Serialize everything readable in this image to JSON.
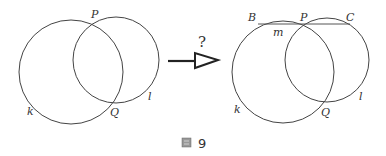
{
  "diagram": {
    "left": {
      "circles": [
        {
          "name": "k",
          "cx": 71,
          "cy": 72,
          "r": 52
        },
        {
          "name": "l",
          "cx": 116,
          "cy": 60,
          "r": 43
        }
      ],
      "labels": {
        "P": "P",
        "Q": "Q",
        "k": "k",
        "l": "l"
      }
    },
    "arrow": {
      "question": "?"
    },
    "right": {
      "circles": [
        {
          "name": "k",
          "cx": 283,
          "cy": 72,
          "r": 51
        },
        {
          "name": "l",
          "cx": 327,
          "cy": 60,
          "r": 42
        }
      ],
      "line": {
        "name": "m",
        "from": "B",
        "to": "C",
        "through": "P"
      },
      "labels": {
        "B": "B",
        "P": "P",
        "C": "C",
        "m": "m",
        "Q": "Q",
        "k": "k",
        "l": "l"
      }
    },
    "caption": {
      "icon": "figure-icon",
      "number": "9"
    }
  },
  "colors": {
    "stroke": "#444444",
    "text": "#333333",
    "background": "#ffffff"
  }
}
